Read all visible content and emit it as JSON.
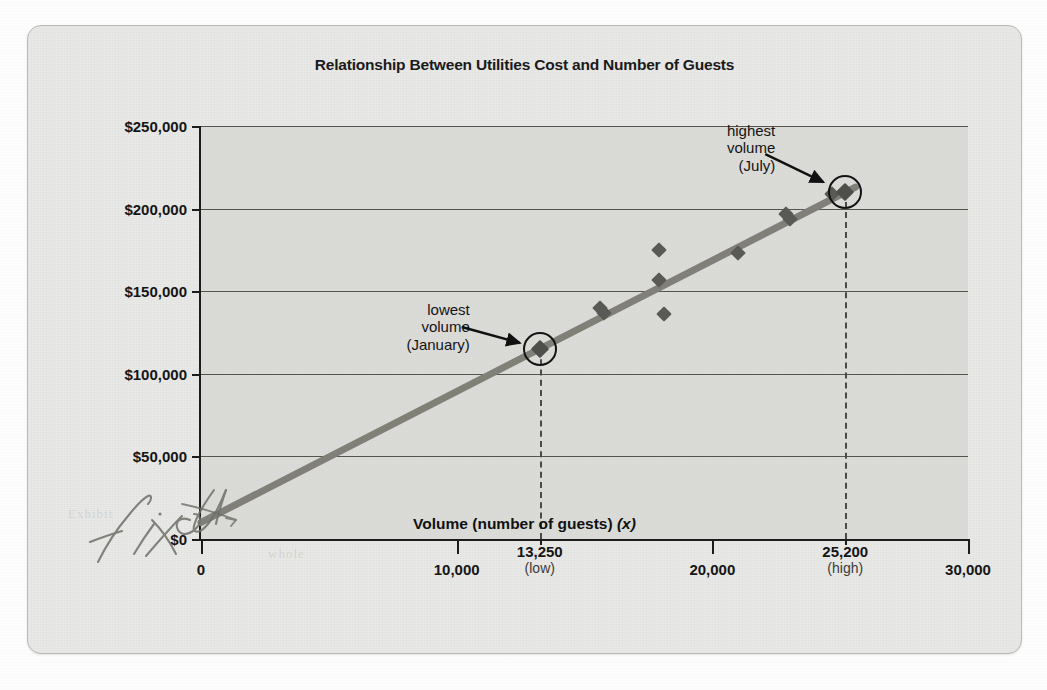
{
  "figure": {
    "title": "Relationship Between Utilities Cost and Number of Guests",
    "y_axis_title_main": "Total utilities cost (",
    "y_axis_title_var": "y",
    "y_axis_title_end": ")",
    "x_axis_title_main": "Volume (number of guests) ",
    "x_axis_title_var": "(x)",
    "handwritten_note": "fixed"
  },
  "annotations": [
    {
      "name": "lowest-volume-callout",
      "line1": "lowest",
      "line2": "volume",
      "line3": "(January)",
      "target_x": 13250,
      "target_y": 115000
    },
    {
      "name": "highest-volume-callout",
      "line1": "highest",
      "line2": "volume",
      "line3": "(July)",
      "target_x": 25200,
      "target_y": 210000
    }
  ],
  "x_special_labels": [
    {
      "value": 13250,
      "label": "13,250",
      "sub": "(low)"
    },
    {
      "value": 25200,
      "label": "25,200",
      "sub": "(high)"
    }
  ],
  "colors": {
    "plot_background": "#d0d0cc",
    "card_background": "#e9e9e7",
    "axis": "#1c1c1c",
    "gridline": "#55554f",
    "regression_line": "#808079",
    "data_point": "#595955",
    "highlight_circle": "#131313",
    "dashed_line": "#4a4a46",
    "pencil": "#6b6b66"
  },
  "ghost_text": [
    {
      "text": "Exhibit",
      "x": 40,
      "y": 480
    },
    {
      "text": "whole",
      "x": 240,
      "y": 520
    }
  ],
  "chart_data": {
    "type": "scatter",
    "title": "Relationship Between Utilities Cost and Number of Guests",
    "xlabel": "Volume (number of guests) (x)",
    "ylabel": "Total utilities cost (y)",
    "xlim": [
      0,
      30000
    ],
    "ylim": [
      0,
      250000
    ],
    "xticks": [
      0,
      10000,
      20000,
      30000
    ],
    "xtick_labels": [
      "0",
      "10,000",
      "20,000",
      "30,000"
    ],
    "yticks": [
      0,
      50000,
      100000,
      150000,
      200000,
      250000
    ],
    "ytick_labels": [
      "$0",
      "$50,000",
      "$100,000",
      "$150,000",
      "$200,000",
      "$250,000"
    ],
    "grid": "horizontal",
    "legend": "none",
    "series": [
      {
        "name": "Monthly utilities cost observations",
        "marker": "diamond",
        "points": [
          {
            "x": 13250,
            "y": 115000,
            "label": "January (lowest volume)",
            "highlighted": true
          },
          {
            "x": 15600,
            "y": 140000,
            "label": ""
          },
          {
            "x": 15750,
            "y": 137000,
            "label": ""
          },
          {
            "x": 17900,
            "y": 175000,
            "label": ""
          },
          {
            "x": 17900,
            "y": 157000,
            "label": ""
          },
          {
            "x": 18100,
            "y": 136000,
            "label": ""
          },
          {
            "x": 21000,
            "y": 173000,
            "label": ""
          },
          {
            "x": 22900,
            "y": 197000,
            "label": ""
          },
          {
            "x": 23050,
            "y": 194000,
            "label": ""
          },
          {
            "x": 24700,
            "y": 209000,
            "label": ""
          },
          {
            "x": 25200,
            "y": 210000,
            "label": "July (highest volume)",
            "highlighted": true
          }
        ]
      }
    ],
    "trendline": {
      "name": "cost formula line",
      "type": "linear",
      "intercept": 10000,
      "slope": 7.94,
      "x_start": 0,
      "x_end": 25600,
      "y_start": 10000,
      "y_end": 213000,
      "color": "#808079"
    },
    "reference_lines": [
      {
        "orientation": "vertical",
        "x": 13250,
        "style": "dashed",
        "from_y": 0,
        "to_y": 115000
      },
      {
        "orientation": "vertical",
        "x": 25200,
        "style": "dashed",
        "from_y": 0,
        "to_y": 210000
      }
    ]
  }
}
